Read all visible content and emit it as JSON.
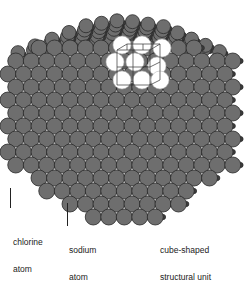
{
  "diagram": {
    "colors": {
      "background": "#ffffff",
      "chlorine": "#6e6e6e",
      "chlorine_edge": "#2a2a2a",
      "sodium": "#3c3c3c",
      "unit_cell_fill": "#ffffff",
      "unit_cell_lines": "#333333"
    },
    "labels": {
      "chlorine": {
        "line1": "chlorine",
        "line2": "atom"
      },
      "sodium": {
        "line1": "sodium",
        "line2": "atom"
      },
      "unit": {
        "line1": "cube-shaped",
        "line2": "structural unit"
      }
    }
  }
}
